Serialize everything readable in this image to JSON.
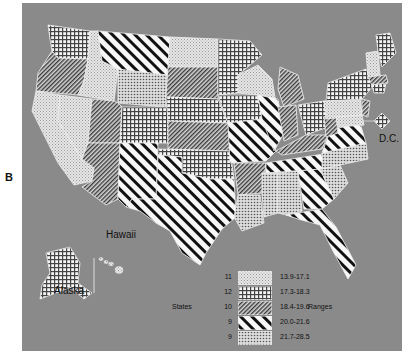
{
  "panel_label": "B",
  "place_labels": {
    "dc": "D.C.",
    "hawaii": "Hawaii",
    "alaska": "Alaska"
  },
  "legend": {
    "states_label": "States",
    "ranges_label": "Ranges",
    "items": [
      {
        "count": "11",
        "range": "13.9-17.1",
        "pattern": "fine-dots"
      },
      {
        "count": "12",
        "range": "17.3-18.3",
        "pattern": "grid"
      },
      {
        "count": "10",
        "range": "18.4-19.6",
        "pattern": "dense-diagonal"
      },
      {
        "count": "9",
        "range": "20.0-21.6",
        "pattern": "bold-diagonal-stripes"
      },
      {
        "count": "9",
        "range": "21.7-28.5",
        "pattern": "stipple"
      }
    ]
  },
  "colors": {
    "background": "#8a8a8a",
    "stripe": "#111111",
    "fill_light": "#f2f2f2"
  }
}
